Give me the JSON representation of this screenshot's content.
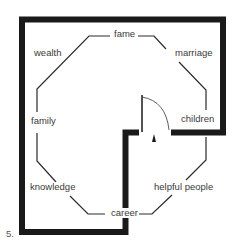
{
  "figure_number": "5.",
  "diagram": {
    "type": "bagua floor plan",
    "areas": {
      "fame": "fame",
      "marriage": "marriage",
      "wealth": "wealth",
      "family": "family",
      "children": "children",
      "knowledge": "knowledge",
      "helpful_people": "helpful people",
      "career": "career"
    },
    "colors": {
      "wall": "#1a1a1a",
      "line": "#2a2a2a",
      "text": "#3a3a3a"
    }
  }
}
